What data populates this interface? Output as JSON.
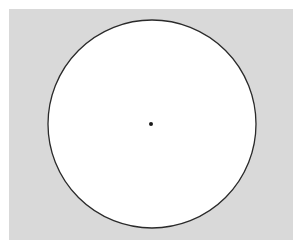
{
  "diagram": {
    "background": {
      "x": 9,
      "y": 9,
      "width": 284,
      "height": 231,
      "color": "#d9d9d9"
    },
    "circle": {
      "cx": 152,
      "cy": 124,
      "r": 104,
      "fill": "#ffffff",
      "stroke": "#2a2a2a"
    },
    "center_point": {
      "cx": 151,
      "cy": 124,
      "r": 2,
      "fill": "#1a1a1a"
    }
  }
}
